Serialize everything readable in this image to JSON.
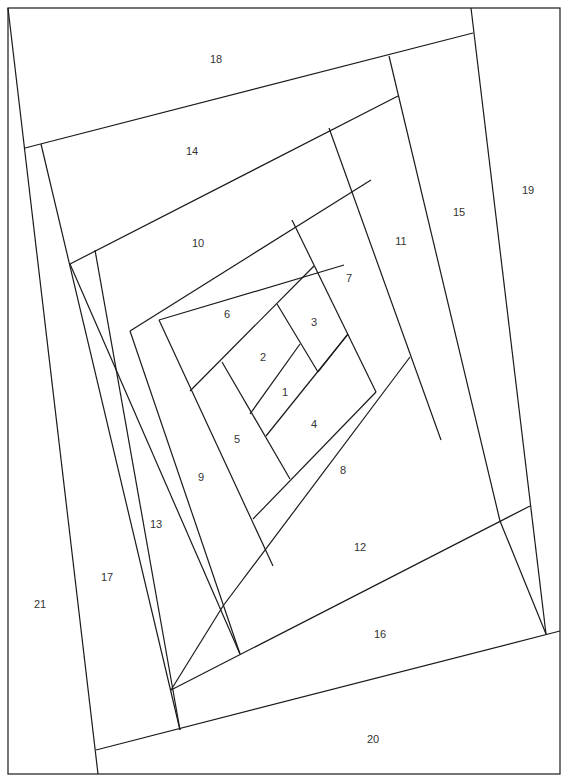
{
  "diagram": {
    "line_color": "#1a1a1a",
    "background": "#ffffff",
    "border": {
      "x": 8,
      "y": 8,
      "w": 552,
      "h": 766
    },
    "segments": [
      [
        8,
        8,
        98,
        774
      ],
      [
        25,
        148,
        473,
        33
      ],
      [
        471,
        8,
        546,
        634
      ],
      [
        96,
        750,
        560,
        631
      ],
      [
        41,
        144,
        180,
        730
      ],
      [
        389,
        56,
        500,
        521
      ],
      [
        70,
        264,
        398,
        96
      ],
      [
        171,
        690,
        530,
        506
      ],
      [
        70,
        264,
        240,
        654
      ],
      [
        329,
        128,
        441,
        440
      ],
      [
        95,
        250,
        180,
        730
      ],
      [
        130,
        331,
        371,
        180
      ],
      [
        130,
        331,
        240,
        654
      ],
      [
        223,
        606,
        410,
        357
      ],
      [
        292,
        220,
        376,
        392
      ],
      [
        159,
        320,
        344,
        265
      ],
      [
        159,
        320,
        273,
        566
      ],
      [
        253,
        519,
        376,
        392
      ],
      [
        190,
        391,
        314,
        266
      ],
      [
        277,
        304,
        318,
        372
      ],
      [
        318,
        372,
        348,
        334
      ],
      [
        222,
        362,
        290,
        479
      ],
      [
        250,
        414,
        300,
        344
      ],
      [
        266,
        436,
        348,
        334
      ],
      [
        171,
        690,
        223,
        606
      ],
      [
        500,
        521,
        546,
        634
      ]
    ],
    "labels": [
      {
        "text": "1",
        "x": 285,
        "y": 392
      },
      {
        "text": "2",
        "x": 263,
        "y": 357
      },
      {
        "text": "3",
        "x": 314,
        "y": 322
      },
      {
        "text": "4",
        "x": 314,
        "y": 424
      },
      {
        "text": "5",
        "x": 237,
        "y": 439
      },
      {
        "text": "6",
        "x": 227,
        "y": 314
      },
      {
        "text": "7",
        "x": 349,
        "y": 278
      },
      {
        "text": "8",
        "x": 343,
        "y": 470
      },
      {
        "text": "9",
        "x": 201,
        "y": 477
      },
      {
        "text": "10",
        "x": 198,
        "y": 243
      },
      {
        "text": "11",
        "x": 401,
        "y": 241
      },
      {
        "text": "12",
        "x": 360,
        "y": 547
      },
      {
        "text": "13",
        "x": 156,
        "y": 524
      },
      {
        "text": "14",
        "x": 192,
        "y": 151
      },
      {
        "text": "15",
        "x": 459,
        "y": 212
      },
      {
        "text": "16",
        "x": 380,
        "y": 634
      },
      {
        "text": "17",
        "x": 107,
        "y": 577
      },
      {
        "text": "18",
        "x": 216,
        "y": 59
      },
      {
        "text": "19",
        "x": 528,
        "y": 190
      },
      {
        "text": "20",
        "x": 373,
        "y": 739
      },
      {
        "text": "21",
        "x": 40,
        "y": 604
      }
    ]
  }
}
